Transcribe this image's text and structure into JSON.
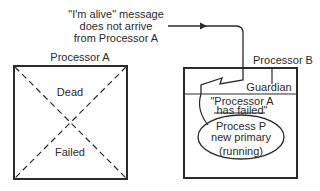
{
  "message": {
    "line1": "\"I'm alive\" message",
    "line2": "does not arrive",
    "line3": "from Processor A"
  },
  "processor_a": {
    "title": "Processor A",
    "state_top": "Dead",
    "state_bottom": "Failed"
  },
  "processor_b": {
    "title": "Processor B",
    "guardian": "Guardian",
    "notice_line1": "\"Processor A",
    "notice_line2": "has failed\"",
    "process_line1": "Process P",
    "process_line2": "new primary",
    "process_line3": "(running)"
  },
  "colors": {
    "stroke": "#2a2a2a",
    "background": "#ffffff"
  }
}
